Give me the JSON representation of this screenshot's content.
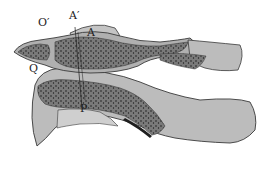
{
  "diagram": {
    "type": "anatomical cross-section (upper cervical vertebrae)",
    "labels": {
      "o_prime": "O′",
      "a_prime": "A′",
      "a": "A",
      "q": "Q",
      "p": "P"
    },
    "colors": {
      "cortical_fill": "#b8b8b8",
      "cancellous_fill": "#7a7a7a",
      "outline": "#3a3a3a",
      "dots": "#1e1e1e",
      "background": "#ffffff"
    }
  }
}
